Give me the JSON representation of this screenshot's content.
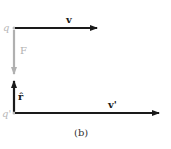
{
  "figure": {
    "caption": "(b)",
    "charges": [
      {
        "label": "q",
        "color": "#b8b8b8"
      },
      {
        "label": "q'",
        "color": "#b8b8b8"
      }
    ],
    "vectors": [
      {
        "label": "v",
        "color": "#1a1a1a",
        "direction": "right"
      },
      {
        "label": "F",
        "color": "#b0b0b0",
        "direction": "down"
      },
      {
        "label": "r̂",
        "color": "#1a1a1a",
        "direction": "up"
      },
      {
        "label": "v'",
        "color": "#1a1a1a",
        "direction": "right"
      }
    ]
  }
}
